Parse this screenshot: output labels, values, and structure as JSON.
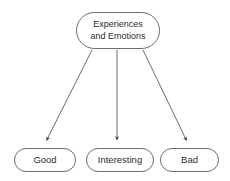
{
  "diagram": {
    "type": "flowchart",
    "background_color": "#ffffff",
    "node_border_color": "#6b6b6b",
    "node_fill_color": "#ffffff",
    "text_color": "#2b2b2b",
    "edge_color": "#5a5a5a",
    "nodes": [
      {
        "id": "root",
        "label": "Experiences\nand Emotions",
        "shape": "rounded-rectangle",
        "role": "parent"
      },
      {
        "id": "good",
        "label": "Good",
        "shape": "rounded-rectangle",
        "role": "child"
      },
      {
        "id": "interesting",
        "label": "Interesting",
        "shape": "rounded-rectangle",
        "role": "child"
      },
      {
        "id": "bad",
        "label": "Bad",
        "shape": "rounded-rectangle",
        "role": "child"
      }
    ],
    "edges": [
      {
        "id": "root-to-good",
        "from": "root",
        "to": "good",
        "arrow": "single",
        "style": "solid"
      },
      {
        "id": "root-to-interesting",
        "from": "root",
        "to": "interesting",
        "arrow": "single",
        "style": "solid"
      },
      {
        "id": "root-to-bad",
        "from": "root",
        "to": "bad",
        "arrow": "single",
        "style": "solid"
      }
    ]
  }
}
